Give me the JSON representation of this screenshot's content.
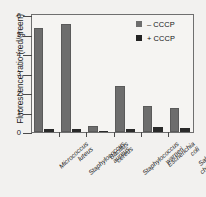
{
  "chart_data": {
    "type": "bar",
    "title": "",
    "xlabel": "",
    "ylabel": "Fluorescence ratio (red/green)",
    "ylim": [
      0,
      6
    ],
    "yticks": [
      "0",
      "1",
      "2",
      "3",
      "4",
      "5",
      "6"
    ],
    "grid": false,
    "legend_position": "top-right",
    "categories": [
      "Micrococcus luteus",
      "Staphylococcus aureus",
      "Bacillus cereus",
      "Staphylococcus warneri",
      "Escherichia coli",
      "Salmonella choleraesuis"
    ],
    "category_lines": [
      [
        "Micrococcus",
        "luteus"
      ],
      [
        "Staphylococcus",
        "aureus"
      ],
      [
        "Bacillus",
        "cereus"
      ],
      [
        "Staphylococcus",
        "warneri"
      ],
      [
        "Escherichia",
        "coli"
      ],
      [
        "Salmonella",
        "choleraesuis"
      ]
    ],
    "series": [
      {
        "name": "– CCCP",
        "color": "#6d6d6d",
        "values": [
          5.35,
          5.55,
          0.3,
          2.35,
          1.35,
          1.22
        ]
      },
      {
        "name": "+ CCCP",
        "color": "#232323",
        "values": [
          0.13,
          0.14,
          0.06,
          0.13,
          0.27,
          0.2
        ]
      }
    ]
  },
  "legend": {
    "items": [
      {
        "label": "– CCCP",
        "swatch": "minus"
      },
      {
        "label": "+ CCCP",
        "swatch": "plus"
      }
    ]
  },
  "colors": {
    "minus_cccp": "#6d6d6d",
    "plus_cccp": "#232323",
    "axis": "#4a4a4a",
    "background": "#f2f1ef"
  }
}
